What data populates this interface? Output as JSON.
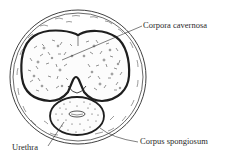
{
  "diagram": {
    "labels": {
      "corpora_cavernosa": "Corpora cavernosa",
      "corpus_spongiosum": "Corpus spongiosum",
      "urethra": "Urethra"
    },
    "colors": {
      "line": "#2a2a2a",
      "background": "#ffffff"
    }
  }
}
